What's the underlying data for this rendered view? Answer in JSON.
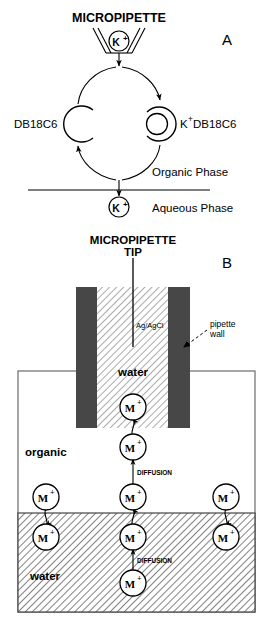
{
  "figure": {
    "panels": [
      {
        "id": "A",
        "letter": "A",
        "title": "MICROPIPETTE",
        "labels": {
          "ion_in_pipette": "K",
          "ion_in_pipette_charge": "+",
          "carrier_free": "DB18C6",
          "carrier_complex_prefix": "K",
          "carrier_complex_charge": "+",
          "carrier_complex_suffix": "DB18C6",
          "phase_upper": "Organic Phase",
          "phase_lower": "Aqueous Phase",
          "ion_transferred": "K",
          "ion_transferred_charge": "+"
        }
      },
      {
        "id": "B",
        "letter": "B",
        "title_line1": "MICROPIPETTE",
        "title_line2": "TIP",
        "labels": {
          "electrode": "Ag/AgCl",
          "pipette_wall_line1": "pipette",
          "pipette_wall_line2": "wall",
          "water_inner": "water",
          "organic": "organic",
          "water_outer": "water",
          "diffusion_upper": "DIFFUSION",
          "diffusion_lower": "DIFFUSION",
          "ion_symbol": "M",
          "ion_charge": "+"
        },
        "ions": [
          {
            "name": "ion-inside-pipette",
            "x": 133,
            "y": 407,
            "region": "water-inner"
          },
          {
            "name": "ion-below-tip",
            "x": 133,
            "y": 447,
            "region": "organic"
          },
          {
            "name": "ion-organic-center",
            "x": 133,
            "y": 497,
            "region": "organic"
          },
          {
            "name": "ion-organic-left",
            "x": 46,
            "y": 497,
            "region": "organic"
          },
          {
            "name": "ion-organic-right",
            "x": 226,
            "y": 497,
            "region": "organic"
          },
          {
            "name": "ion-water-center",
            "x": 133,
            "y": 537,
            "region": "water-outer"
          },
          {
            "name": "ion-water-left",
            "x": 46,
            "y": 537,
            "region": "water-outer"
          },
          {
            "name": "ion-water-right",
            "x": 226,
            "y": 537,
            "region": "water-outer"
          },
          {
            "name": "ion-water-bottom",
            "x": 133,
            "y": 583,
            "region": "water-outer"
          }
        ]
      }
    ],
    "colors": {
      "ink": "#000000",
      "pipette_wall": "#474747",
      "hatch": "#000000",
      "background": "#ffffff",
      "cell_outline": "#6b6b6b"
    }
  }
}
